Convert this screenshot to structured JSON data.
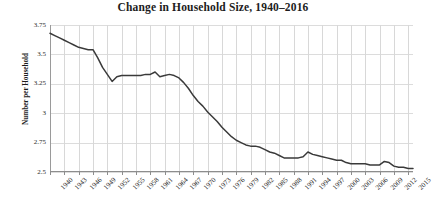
{
  "chart_data": {
    "type": "line",
    "title": "Change in Household Size, 1940–2016",
    "xlabel": "",
    "ylabel": "Number per Household",
    "xlim": [
      1940,
      2016
    ],
    "ylim": [
      2.5,
      3.75
    ],
    "yticks": [
      "3.75",
      "3.5",
      "3.25",
      "3",
      "2.75",
      "2.5"
    ],
    "ytick_values": [
      3.75,
      3.5,
      3.25,
      3,
      2.75,
      2.5
    ],
    "xticks": [
      "1940",
      "1943",
      "1946",
      "1949",
      "1952",
      "1955",
      "1958",
      "1961",
      "1964",
      "1967",
      "1970",
      "1973",
      "1976",
      "1979",
      "1982",
      "1985",
      "1988",
      "1991",
      "1994",
      "1997",
      "2000",
      "2003",
      "2006",
      "2009",
      "2012",
      "2015"
    ],
    "xtick_values": [
      1940,
      1943,
      1946,
      1949,
      1952,
      1955,
      1958,
      1961,
      1964,
      1967,
      1970,
      1973,
      1976,
      1979,
      1982,
      1985,
      1988,
      1991,
      1994,
      1997,
      2000,
      2003,
      2006,
      2009,
      2012,
      2015
    ],
    "grid": true,
    "grid_color": "#dcdcdc",
    "legend": false,
    "line_color": "#3a3a3a",
    "line_width": 1.5,
    "background": "#ffffff",
    "x": [
      1940,
      1941,
      1942,
      1943,
      1944,
      1945,
      1946,
      1947,
      1948,
      1949,
      1950,
      1951,
      1952,
      1953,
      1954,
      1955,
      1956,
      1957,
      1958,
      1959,
      1960,
      1961,
      1962,
      1963,
      1964,
      1965,
      1966,
      1967,
      1968,
      1969,
      1970,
      1971,
      1972,
      1973,
      1974,
      1975,
      1976,
      1977,
      1978,
      1979,
      1980,
      1981,
      1982,
      1983,
      1984,
      1985,
      1986,
      1987,
      1988,
      1989,
      1990,
      1991,
      1992,
      1993,
      1994,
      1995,
      1996,
      1997,
      1998,
      1999,
      2000,
      2001,
      2002,
      2003,
      2004,
      2005,
      2006,
      2007,
      2008,
      2009,
      2010,
      2011,
      2012,
      2013,
      2014,
      2015,
      2016
    ],
    "values": [
      3.68,
      3.66,
      3.64,
      3.62,
      3.6,
      3.58,
      3.56,
      3.55,
      3.54,
      3.54,
      3.47,
      3.39,
      3.33,
      3.27,
      3.31,
      3.32,
      3.32,
      3.32,
      3.32,
      3.32,
      3.33,
      3.33,
      3.35,
      3.31,
      3.32,
      3.33,
      3.32,
      3.3,
      3.26,
      3.21,
      3.15,
      3.1,
      3.06,
      3.01,
      2.97,
      2.93,
      2.88,
      2.84,
      2.8,
      2.77,
      2.75,
      2.73,
      2.72,
      2.72,
      2.71,
      2.69,
      2.67,
      2.66,
      2.64,
      2.62,
      2.62,
      2.62,
      2.62,
      2.63,
      2.67,
      2.65,
      2.64,
      2.63,
      2.62,
      2.61,
      2.6,
      2.6,
      2.58,
      2.57,
      2.57,
      2.57,
      2.57,
      2.56,
      2.56,
      2.56,
      2.59,
      2.58,
      2.55,
      2.54,
      2.54,
      2.53,
      2.53
    ],
    "series": [
      {
        "name": "Number per Household",
        "values": [
          3.68,
          3.66,
          3.64,
          3.62,
          3.6,
          3.58,
          3.56,
          3.55,
          3.54,
          3.54,
          3.47,
          3.39,
          3.33,
          3.27,
          3.31,
          3.32,
          3.32,
          3.32,
          3.32,
          3.32,
          3.33,
          3.33,
          3.35,
          3.31,
          3.32,
          3.33,
          3.32,
          3.3,
          3.26,
          3.21,
          3.15,
          3.1,
          3.06,
          3.01,
          2.97,
          2.93,
          2.88,
          2.84,
          2.8,
          2.77,
          2.75,
          2.73,
          2.72,
          2.72,
          2.71,
          2.69,
          2.67,
          2.66,
          2.64,
          2.62,
          2.62,
          2.62,
          2.62,
          2.63,
          2.67,
          2.65,
          2.64,
          2.63,
          2.62,
          2.61,
          2.6,
          2.6,
          2.58,
          2.57,
          2.57,
          2.57,
          2.57,
          2.56,
          2.56,
          2.56,
          2.59,
          2.58,
          2.55,
          2.54,
          2.54,
          2.53,
          2.53
        ]
      }
    ]
  }
}
